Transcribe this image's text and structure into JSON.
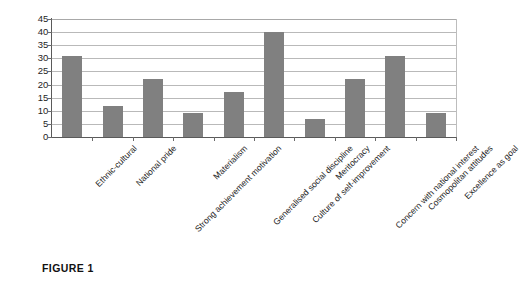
{
  "figure": {
    "caption_label": "FIGURE 1",
    "caption_subtext": ""
  },
  "chart_data": {
    "type": "bar",
    "title": "",
    "subtitle": "",
    "xlabel": "",
    "ylabel": "",
    "ylim": [
      0,
      45
    ],
    "ytick_step": 5,
    "grid": true,
    "legend": false,
    "legend_position": "none",
    "bar_color": "#808080",
    "gridline_color": "#b9b9b9",
    "axis_color": "#5a5a5a",
    "yticks": [
      0,
      5,
      10,
      15,
      20,
      25,
      30,
      35,
      40,
      45
    ],
    "categories": [
      "Ethnic-cultural",
      "National pride",
      "Strong achievement motivation",
      "Materialism",
      "Generalised social discipline",
      "Culture of self-improvement",
      "Meritocracy",
      "Concern with national interest",
      "Cosmopolitan attitudes",
      "Excellence as goal"
    ],
    "values": [
      31,
      12,
      22,
      9,
      17,
      40,
      7,
      22,
      31,
      9
    ]
  }
}
